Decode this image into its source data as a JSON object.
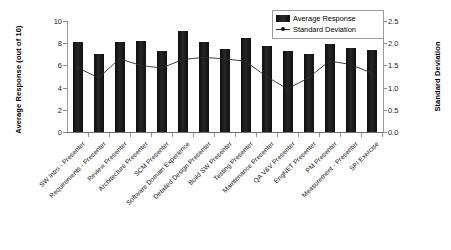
{
  "chart_data": {
    "type": "bar",
    "title": "",
    "subtitle": "",
    "xlabel": "",
    "ylabel": "Average Response (out of 10)",
    "y2label": "Standard Deviation",
    "grid": false,
    "legend_position": "top-right",
    "ylim": [
      0,
      10
    ],
    "y2lim": [
      0,
      2.5
    ],
    "yticks": [
      "0",
      "2",
      "4",
      "6",
      "8",
      "10"
    ],
    "ytick_values": [
      0,
      2,
      4,
      6,
      8,
      10
    ],
    "y2ticks": [
      "0.0",
      "0.5",
      "1.0",
      "1.5",
      "2.0",
      "2.5"
    ],
    "y2tick_values": [
      0.0,
      0.5,
      1.0,
      1.5,
      2.0,
      2.5
    ],
    "categories": [
      "SW Intro - Presenter",
      "Requirements - Presenter",
      "Review Presenter",
      "Architecture Presenter",
      "SCM Presenter",
      "Software Domain Experience",
      "Detailed Design Presenter",
      "Build SW Presenter",
      "Testing Presenter",
      "Maintenance Presenter",
      "QA V&V Presenter",
      "EngNET Presenter",
      "PM Presenter",
      "Measurement - Presenter",
      "SPI Exercise"
    ],
    "series": [
      {
        "name": "Average Response",
        "axis": "left",
        "kind": "bar",
        "color": "#151515",
        "values": [
          8.1,
          7.0,
          8.1,
          8.2,
          7.3,
          9.1,
          8.1,
          7.5,
          8.5,
          7.75,
          7.3,
          7.0,
          7.9,
          7.6,
          7.4
        ]
      },
      {
        "name": "Standard Deviation",
        "axis": "right",
        "kind": "line",
        "color": "#2b2b2b",
        "values": [
          1.45,
          1.22,
          1.65,
          1.5,
          1.44,
          1.63,
          1.68,
          1.65,
          1.59,
          1.25,
          0.97,
          1.22,
          1.6,
          1.52,
          1.33
        ]
      }
    ]
  },
  "legend": {
    "items": [
      {
        "label": "Average Response",
        "marker": "bar-swatch-icon"
      },
      {
        "label": "Standard Deviation",
        "marker": "line-marker-icon"
      }
    ]
  }
}
